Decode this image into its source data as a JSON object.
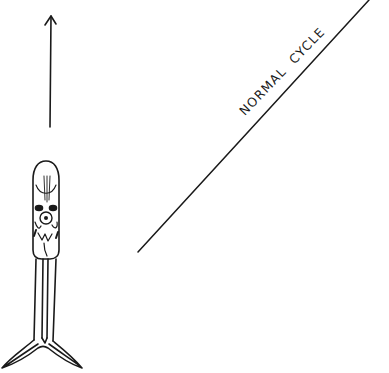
{
  "diagram": {
    "label": "NORMAL  CYCLE",
    "stroke_color": "#1a1a1a",
    "background": "#ffffff",
    "elements": {
      "direction_arrow": "up-arrow-icon",
      "figure": "swimming-organism",
      "diagonal_line": "cycle-line"
    }
  }
}
